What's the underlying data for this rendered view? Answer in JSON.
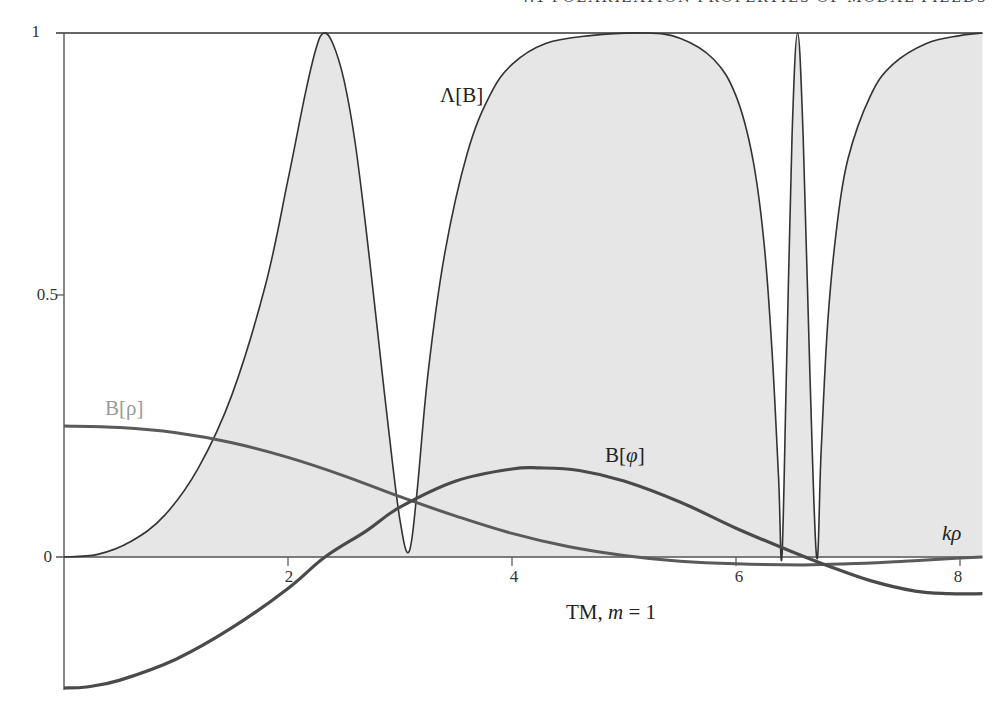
{
  "page": {
    "header_fragment": "4.1 POLARIZATION PROPERTIES OF MODAL FIELDS"
  },
  "colors": {
    "fill": "#e6e6e6",
    "lambda_line": "#333333",
    "b_rho_line": "#5a5a5a",
    "b_phi_line": "#4a4a4a",
    "b_rho_label": "#9a9a9a",
    "axis": "#555555"
  },
  "labels": {
    "lambda": "Λ[B]",
    "b_rho": "B[ρ]",
    "b_phi_prefix": "B[",
    "b_phi_symbol": "φ",
    "b_phi_suffix": "]",
    "xlabel_k": "k",
    "xlabel_rho": "ρ",
    "caption_prefix": "TM, ",
    "caption_m": "m",
    "caption_suffix": " = 1"
  },
  "chart_data": {
    "type": "line",
    "title": "TM, m = 1",
    "xlabel": "kρ",
    "ylabel": "",
    "xlim": [
      0,
      8.2
    ],
    "ylim": [
      -0.25,
      1
    ],
    "x_ticks": [
      2,
      4,
      6,
      8
    ],
    "y_ticks": [
      0,
      0.5,
      1
    ],
    "y_tick_labels": [
      "0",
      "0.5",
      "1"
    ],
    "grid": false,
    "legend": "inline labels",
    "series": [
      {
        "name": "Λ[B]",
        "filled": true,
        "points": [
          [
            0,
            0
          ],
          [
            0.3,
            0.005
          ],
          [
            0.6,
            0.03
          ],
          [
            0.9,
            0.08
          ],
          [
            1.2,
            0.17
          ],
          [
            1.5,
            0.31
          ],
          [
            1.8,
            0.52
          ],
          [
            2.0,
            0.72
          ],
          [
            2.15,
            0.88
          ],
          [
            2.25,
            0.97
          ],
          [
            2.32,
            1.0
          ],
          [
            2.4,
            0.98
          ],
          [
            2.5,
            0.91
          ],
          [
            2.6,
            0.79
          ],
          [
            2.7,
            0.62
          ],
          [
            2.8,
            0.43
          ],
          [
            2.9,
            0.24
          ],
          [
            3.0,
            0.07
          ],
          [
            3.08,
            0.01
          ],
          [
            3.15,
            0.12
          ],
          [
            3.25,
            0.35
          ],
          [
            3.4,
            0.58
          ],
          [
            3.6,
            0.77
          ],
          [
            3.8,
            0.88
          ],
          [
            4.0,
            0.94
          ],
          [
            4.3,
            0.98
          ],
          [
            4.7,
            0.995
          ],
          [
            5.18,
            1.0
          ],
          [
            5.5,
            0.99
          ],
          [
            5.8,
            0.95
          ],
          [
            6.0,
            0.88
          ],
          [
            6.15,
            0.76
          ],
          [
            6.25,
            0.6
          ],
          [
            6.32,
            0.4
          ],
          [
            6.38,
            0.15
          ],
          [
            6.41,
            0.0
          ],
          [
            6.45,
            0.35
          ],
          [
            6.5,
            0.8
          ],
          [
            6.55,
            1.0
          ],
          [
            6.6,
            0.8
          ],
          [
            6.66,
            0.35
          ],
          [
            6.72,
            0.0
          ],
          [
            6.76,
            0.2
          ],
          [
            6.82,
            0.45
          ],
          [
            6.9,
            0.63
          ],
          [
            7.0,
            0.76
          ],
          [
            7.2,
            0.88
          ],
          [
            7.4,
            0.94
          ],
          [
            7.7,
            0.98
          ],
          [
            8.0,
            0.995
          ],
          [
            8.2,
            1.0
          ]
        ]
      },
      {
        "name": "B[ρ]",
        "filled": false,
        "points": [
          [
            0,
            0.25
          ],
          [
            0.5,
            0.247
          ],
          [
            1.0,
            0.237
          ],
          [
            1.5,
            0.218
          ],
          [
            2.0,
            0.19
          ],
          [
            2.5,
            0.155
          ],
          [
            3.0,
            0.115
          ],
          [
            3.5,
            0.078
          ],
          [
            4.0,
            0.045
          ],
          [
            4.5,
            0.02
          ],
          [
            5.0,
            0.003
          ],
          [
            5.5,
            -0.008
          ],
          [
            6.0,
            -0.013
          ],
          [
            6.6,
            -0.015
          ],
          [
            7.0,
            -0.013
          ],
          [
            7.5,
            -0.008
          ],
          [
            8.0,
            -0.002
          ],
          [
            8.2,
            0.0
          ]
        ]
      },
      {
        "name": "B[φ]",
        "filled": false,
        "points": [
          [
            0,
            -0.25
          ],
          [
            0.2,
            -0.248
          ],
          [
            0.5,
            -0.235
          ],
          [
            1.0,
            -0.195
          ],
          [
            1.5,
            -0.135
          ],
          [
            2.0,
            -0.06
          ],
          [
            2.33,
            0.0
          ],
          [
            2.7,
            0.05
          ],
          [
            3.0,
            0.095
          ],
          [
            3.5,
            0.145
          ],
          [
            4.0,
            0.168
          ],
          [
            4.25,
            0.17
          ],
          [
            4.6,
            0.165
          ],
          [
            5.0,
            0.145
          ],
          [
            5.5,
            0.105
          ],
          [
            6.0,
            0.055
          ],
          [
            6.5,
            0.01
          ],
          [
            6.8,
            -0.015
          ],
          [
            7.2,
            -0.045
          ],
          [
            7.6,
            -0.065
          ],
          [
            7.9,
            -0.07
          ],
          [
            8.2,
            -0.07
          ]
        ]
      }
    ]
  }
}
